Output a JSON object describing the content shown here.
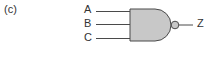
{
  "figure": {
    "panel_label": "(c)",
    "gate_type": "NAND",
    "inputs": [
      {
        "label": "A"
      },
      {
        "label": "B"
      },
      {
        "label": "C"
      }
    ],
    "output": {
      "label": "Z"
    },
    "colors": {
      "gate_fill": "#c8c8c8",
      "stroke": "#4a4a4a",
      "text": "#333333"
    }
  }
}
